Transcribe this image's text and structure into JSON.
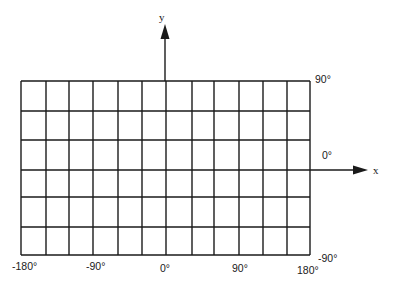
{
  "diagram": {
    "axes": {
      "x": {
        "name": "x",
        "arrow_tip": [
          367,
          170
        ]
      },
      "y": {
        "name": "y",
        "arrow_tip": [
          165,
          26
        ]
      }
    },
    "grid": {
      "vertical_lines_x": [
        21,
        46,
        69,
        93,
        118,
        142,
        166,
        192,
        214,
        239,
        263,
        287,
        310
      ],
      "horizontal_lines_y": [
        81,
        111,
        140,
        170,
        197,
        227,
        255
      ],
      "columns": 12,
      "rows": 6,
      "stroke_color": "#1a1a1a"
    },
    "longitude_labels": [
      {
        "text": "-180°",
        "x": 12,
        "y": 270
      },
      {
        "text": "-90°",
        "x": 86,
        "y": 270
      },
      {
        "text": "0°",
        "x": 160,
        "y": 272
      },
      {
        "text": "90°",
        "x": 232,
        "y": 272
      },
      {
        "text": "180°",
        "x": 297,
        "y": 274
      }
    ],
    "latitude_labels": [
      {
        "text": "90°",
        "x": 315,
        "y": 83
      },
      {
        "text": "0°",
        "x": 322,
        "y": 159
      },
      {
        "text": "-90°",
        "x": 318,
        "y": 262
      }
    ]
  }
}
